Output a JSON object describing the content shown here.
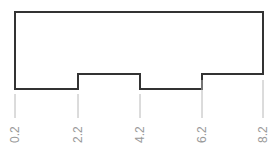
{
  "diagram": {
    "type": "stepped-profile",
    "outline_color": "#333333",
    "tick_color": "#b8b8b8",
    "label_color": "#9a9a9a",
    "ticks": [
      {
        "value": 0.2,
        "label": "0.2"
      },
      {
        "value": 2.2,
        "label": "2.2"
      },
      {
        "value": 4.2,
        "label": "4.2"
      },
      {
        "value": 6.2,
        "label": "6.2"
      },
      {
        "value": 8.2,
        "label": "8.2"
      }
    ],
    "profile": [
      {
        "from": "0.2",
        "to": "2.2",
        "level": "low"
      },
      {
        "from": "2.2",
        "to": "4.2",
        "level": "high"
      },
      {
        "from": "4.2",
        "to": "6.2",
        "level": "low"
      },
      {
        "from": "6.2",
        "to": "8.2",
        "level": "high"
      }
    ]
  }
}
